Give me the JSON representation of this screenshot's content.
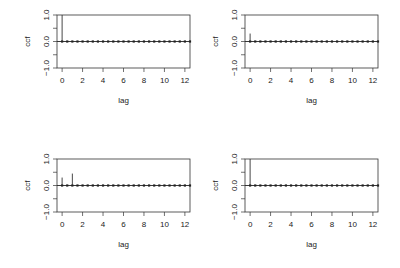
{
  "chart_data": [
    {
      "type": "bar",
      "subtype": "ccf-lollipop",
      "title": "",
      "xlabel": "lag",
      "ylabel": "ccf",
      "xlim": [
        -0.5,
        12.5
      ],
      "ylim": [
        -1.0,
        1.0
      ],
      "xticks": [
        0,
        2,
        4,
        6,
        8,
        10,
        12
      ],
      "yticks": [
        -1.0,
        -0.5,
        0.0,
        0.5,
        1.0
      ],
      "ytick_labels": [
        "-1.0",
        "",
        "0.0",
        "",
        "1.0"
      ],
      "spikes": [
        {
          "lag": 0,
          "value": 1.0
        }
      ],
      "baseline_markers_step": 0.5,
      "grid": false
    },
    {
      "type": "bar",
      "subtype": "ccf-lollipop",
      "title": "",
      "xlabel": "lag",
      "ylabel": "ccf",
      "xlim": [
        -0.5,
        12.5
      ],
      "ylim": [
        -1.0,
        1.0
      ],
      "xticks": [
        0,
        2,
        4,
        6,
        8,
        10,
        12
      ],
      "yticks": [
        -1.0,
        -0.5,
        0.0,
        0.5,
        1.0
      ],
      "ytick_labels": [
        "-1.0",
        "",
        "0.0",
        "",
        "1.0"
      ],
      "spikes": [
        {
          "lag": 0,
          "value": 0.3
        }
      ],
      "baseline_markers_step": 0.5,
      "grid": false
    },
    {
      "type": "bar",
      "subtype": "ccf-lollipop",
      "title": "",
      "xlabel": "lag",
      "ylabel": "ccf",
      "xlim": [
        -0.5,
        12.5
      ],
      "ylim": [
        -1.0,
        1.0
      ],
      "xticks": [
        0,
        2,
        4,
        6,
        8,
        10,
        12
      ],
      "yticks": [
        -1.0,
        -0.5,
        0.0,
        0.5,
        1.0
      ],
      "ytick_labels": [
        "-1.0",
        "",
        "0.0",
        "",
        "1.0"
      ],
      "spikes": [
        {
          "lag": 0,
          "value": 0.3
        },
        {
          "lag": 1,
          "value": 0.45
        }
      ],
      "baseline_markers_step": 0.5,
      "grid": false
    },
    {
      "type": "bar",
      "subtype": "ccf-lollipop",
      "title": "",
      "xlabel": "lag",
      "ylabel": "ccf",
      "xlim": [
        -0.5,
        12.5
      ],
      "ylim": [
        -1.0,
        1.0
      ],
      "xticks": [
        0,
        2,
        4,
        6,
        8,
        10,
        12
      ],
      "yticks": [
        -1.0,
        -0.5,
        0.0,
        0.5,
        1.0
      ],
      "ytick_labels": [
        "-1.0",
        "",
        "0.0",
        "",
        "1.0"
      ],
      "spikes": [
        {
          "lag": 0,
          "value": 1.0
        }
      ],
      "baseline_markers_step": 0.5,
      "grid": false
    }
  ],
  "layout": {
    "panels": [
      {
        "id": "top-left",
        "left": 0,
        "top": 0
      },
      {
        "id": "top-right",
        "left": 188,
        "top": 0
      },
      {
        "id": "bottom-left",
        "left": 0,
        "top": 144
      },
      {
        "id": "bottom-right",
        "left": 188,
        "top": 144
      }
    ]
  }
}
